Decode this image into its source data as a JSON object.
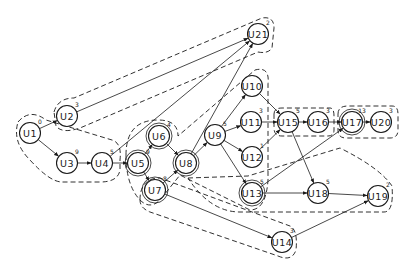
{
  "diagram": {
    "type": "directed-graph",
    "nodes": [
      {
        "id": "U1",
        "label": "U1",
        "weight": "0",
        "x": 30,
        "y": 133
      },
      {
        "id": "U2",
        "label": "U2",
        "weight": "3",
        "x": 67,
        "y": 116
      },
      {
        "id": "U3",
        "label": "U3",
        "weight": "9",
        "x": 67,
        "y": 163
      },
      {
        "id": "U4",
        "label": "U4",
        "weight": "5",
        "x": 102,
        "y": 163
      },
      {
        "id": "U5",
        "label": "U5",
        "weight": "9",
        "x": 138,
        "y": 163
      },
      {
        "id": "U6",
        "label": "U6",
        "weight": "4",
        "x": 159,
        "y": 136
      },
      {
        "id": "U7",
        "label": "U7",
        "weight": "8",
        "x": 155,
        "y": 190
      },
      {
        "id": "U8",
        "label": "U8",
        "weight": "",
        "x": 186,
        "y": 163
      },
      {
        "id": "U9",
        "label": "U9",
        "weight": "5",
        "x": 215,
        "y": 135
      },
      {
        "id": "U10",
        "label": "U10",
        "weight": "",
        "x": 252,
        "y": 86
      },
      {
        "id": "U11",
        "label": "U11",
        "weight": "3",
        "x": 251,
        "y": 122
      },
      {
        "id": "U12",
        "label": "U12",
        "weight": "1",
        "x": 252,
        "y": 157
      },
      {
        "id": "U13",
        "label": "U13",
        "weight": "5",
        "x": 252,
        "y": 193
      },
      {
        "id": "U14",
        "label": "U14",
        "weight": "3",
        "x": 282,
        "y": 242
      },
      {
        "id": "U15",
        "label": "U15",
        "weight": "5",
        "x": 288,
        "y": 122
      },
      {
        "id": "U16",
        "label": "U16",
        "weight": "3",
        "x": 318,
        "y": 122
      },
      {
        "id": "U17",
        "label": "U17",
        "weight": "13",
        "x": 352,
        "y": 122
      },
      {
        "id": "U18",
        "label": "U18",
        "weight": "5",
        "x": 318,
        "y": 193
      },
      {
        "id": "U19",
        "label": "U19",
        "weight": "2",
        "x": 378,
        "y": 196
      },
      {
        "id": "U20",
        "label": "U20",
        "weight": "3",
        "x": 381,
        "y": 122
      },
      {
        "id": "U21",
        "label": "U21",
        "weight": "2",
        "x": 258,
        "y": 34
      }
    ],
    "edges": [
      [
        "U1",
        "U2"
      ],
      [
        "U1",
        "U3"
      ],
      [
        "U3",
        "U4"
      ],
      [
        "U4",
        "U5"
      ],
      [
        "U2",
        "U21"
      ],
      [
        "U4",
        "U21"
      ],
      [
        "U5",
        "U6"
      ],
      [
        "U5",
        "U7"
      ],
      [
        "U6",
        "U8"
      ],
      [
        "U7",
        "U8"
      ],
      [
        "U8",
        "U9"
      ],
      [
        "U9",
        "U10"
      ],
      [
        "U9",
        "U11"
      ],
      [
        "U9",
        "U12"
      ],
      [
        "U9",
        "U13"
      ],
      [
        "U10",
        "U15"
      ],
      [
        "U11",
        "U15"
      ],
      [
        "U12",
        "U15"
      ],
      [
        "U15",
        "U16"
      ],
      [
        "U16",
        "U17"
      ],
      [
        "U17",
        "U20"
      ],
      [
        "U15",
        "U18"
      ],
      [
        "U13",
        "U18"
      ],
      [
        "U13",
        "U17"
      ],
      [
        "U18",
        "U19"
      ],
      [
        "U7",
        "U14"
      ],
      [
        "U14",
        "U19"
      ],
      [
        "U8",
        "U21"
      ]
    ]
  }
}
